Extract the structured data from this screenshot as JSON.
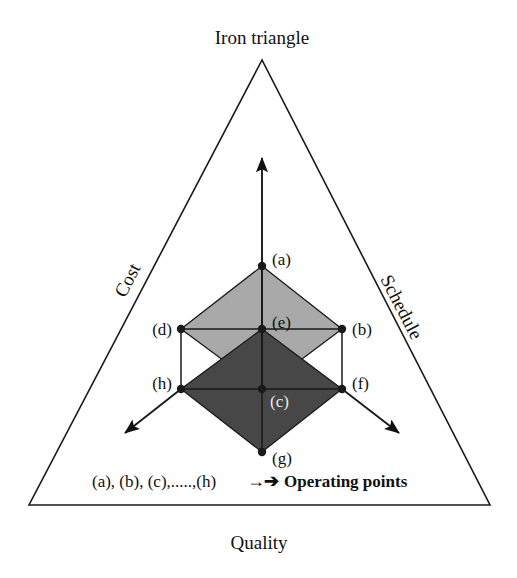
{
  "figure": {
    "title": "Iron triangle",
    "background_color": "#ffffff",
    "line_color": "#1a1a1a"
  },
  "axes": {
    "left_label": "Cost",
    "right_label": "Schedule",
    "bottom_label": "Quality"
  },
  "triangle": {
    "apex": [
      262,
      60
    ],
    "bottom_left": [
      29,
      505
    ],
    "bottom_right": [
      490,
      505
    ]
  },
  "arrows": {
    "up": {
      "from": [
        262,
        389
      ],
      "to": [
        262,
        158
      ]
    },
    "down_left": {
      "from": [
        181,
        389
      ],
      "to": [
        125,
        433
      ]
    },
    "down_right": {
      "from": [
        342,
        389
      ],
      "to": [
        399,
        433
      ]
    }
  },
  "shapes": {
    "upper_diamond": {
      "name": "upper-diamond",
      "fill": "#a9a9a9",
      "points": "262,266 342,329 262,389 181,329"
    },
    "lower_diamond": {
      "name": "lower-diamond",
      "fill": "#474747",
      "points": "262,329 342,389 262,452 181,389"
    }
  },
  "operating_points": [
    {
      "id": "a",
      "label": "(a)",
      "x": 262,
      "y": 266,
      "label_x": 272,
      "label_y": 265,
      "label_anchor": "start",
      "label_color": "dark"
    },
    {
      "id": "b",
      "label": "(b)",
      "x": 342,
      "y": 329,
      "label_x": 352,
      "label_y": 335,
      "label_anchor": "start",
      "label_color": "dark"
    },
    {
      "id": "c",
      "label": "(c)",
      "x": 262,
      "y": 389,
      "label_x": 270,
      "label_y": 407,
      "label_anchor": "start",
      "label_color": "light"
    },
    {
      "id": "d",
      "label": "(d)",
      "x": 181,
      "y": 329,
      "label_x": 172,
      "label_y": 335,
      "label_anchor": "end",
      "label_color": "dark"
    },
    {
      "id": "e",
      "label": "(e)",
      "x": 262,
      "y": 329,
      "label_x": 272,
      "label_y": 328,
      "label_anchor": "start",
      "label_color": "dark"
    },
    {
      "id": "f",
      "label": "(f)",
      "x": 342,
      "y": 389,
      "label_x": 352,
      "label_y": 389,
      "label_anchor": "start",
      "label_color": "dark"
    },
    {
      "id": "g",
      "label": "(g)",
      "x": 262,
      "y": 452,
      "label_x": 272,
      "label_y": 464,
      "label_anchor": "start",
      "label_color": "dark"
    },
    {
      "id": "h",
      "label": "(h)",
      "x": 181,
      "y": 389,
      "label_x": 172,
      "label_y": 389,
      "label_anchor": "end",
      "label_color": "dark"
    }
  ],
  "connector_edges": [
    {
      "name": "edge-d-h",
      "from": [
        181,
        329
      ],
      "to": [
        181,
        389
      ]
    },
    {
      "name": "edge-b-f",
      "from": [
        342,
        329
      ],
      "to": [
        342,
        389
      ]
    },
    {
      "name": "edge-a-e",
      "from": [
        262,
        266
      ],
      "to": [
        262,
        329
      ]
    },
    {
      "name": "edge-e-c",
      "from": [
        262,
        329
      ],
      "to": [
        262,
        389
      ]
    },
    {
      "name": "edge-c-g",
      "from": [
        262,
        389
      ],
      "to": [
        262,
        452
      ]
    },
    {
      "name": "edge-d-e",
      "from": [
        181,
        329
      ],
      "to": [
        262,
        329
      ]
    },
    {
      "name": "edge-e-b",
      "from": [
        262,
        329
      ],
      "to": [
        342,
        329
      ]
    },
    {
      "name": "edge-h-c",
      "from": [
        181,
        389
      ],
      "to": [
        262,
        389
      ]
    },
    {
      "name": "edge-c-f",
      "from": [
        262,
        389
      ],
      "to": [
        342,
        389
      ]
    }
  ],
  "legend": {
    "points_list": "(a), (b), (c),.....,(h)",
    "arrow_glyph": "→",
    "arrow_glyph_2": "➔",
    "meaning": "Operating points",
    "x": 92,
    "y": 487
  },
  "title_position": {
    "x": 262,
    "y": 44
  }
}
